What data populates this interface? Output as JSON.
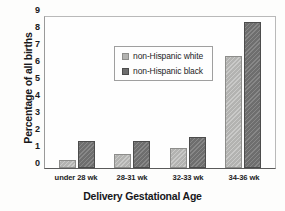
{
  "chart_data": {
    "type": "bar",
    "title": "",
    "xlabel": "Delivery Gestational Age",
    "ylabel": "Percentage of all births",
    "categories": [
      "under 28 wk",
      "28-31 wk",
      "32-33 wk",
      "34-36 wk"
    ],
    "series": [
      {
        "name": "non-Hispanic white",
        "color": "#b3b3b1",
        "values": [
          0.5,
          0.85,
          1.15,
          6.6
        ]
      },
      {
        "name": "non-Hispanic black",
        "color": "#6e6e6e",
        "values": [
          1.6,
          1.6,
          1.8,
          8.6
        ]
      }
    ],
    "ylim": [
      0,
      9
    ],
    "yticks": [
      "0",
      "1",
      "2",
      "3",
      "4",
      "5",
      "6",
      "7",
      "8",
      "9"
    ],
    "grid": false,
    "legend_position": "upper-left-inside"
  }
}
